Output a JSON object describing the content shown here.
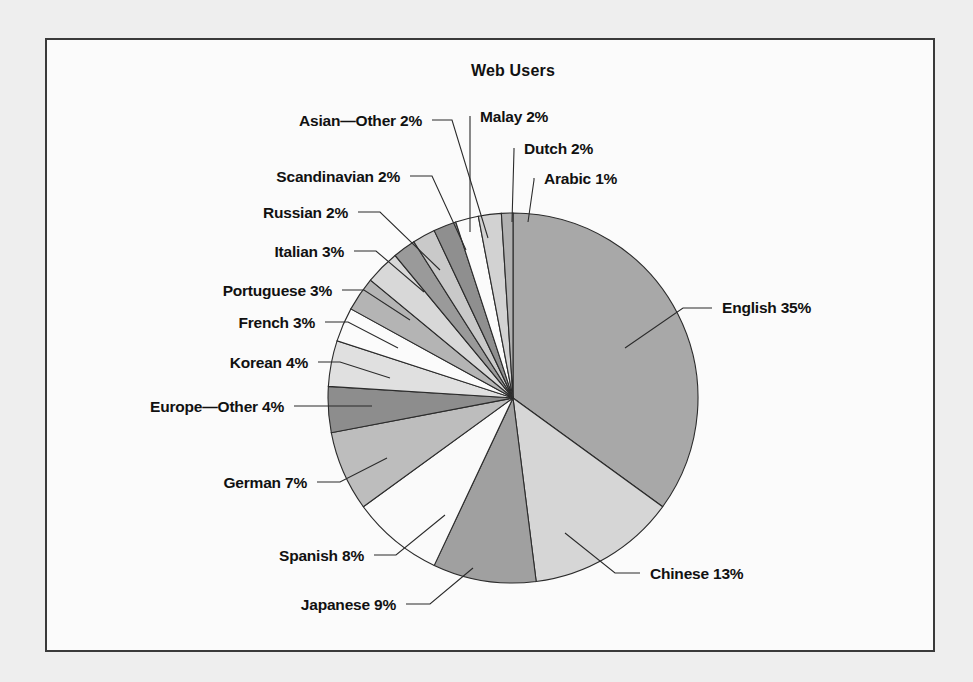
{
  "figure": {
    "title": "Web Users",
    "border_color": "#3a3a3a",
    "panel_background": "#fbfbfb",
    "page_background": "#eeeeee"
  },
  "chart_data": {
    "type": "pie",
    "title": "Web Users",
    "unit": "percent",
    "start_angle_deg": 0,
    "direction": "clockwise",
    "legend": "none",
    "labels_style": "leader-lines",
    "categories": [
      "English",
      "Chinese",
      "Japanese",
      "Spanish",
      "German",
      "Europe—Other",
      "Korean",
      "French",
      "Portuguese",
      "Italian",
      "Russian",
      "Scandinavian",
      "Asian—Other",
      "Malay",
      "Dutch",
      "Arabic"
    ],
    "values": [
      35,
      13,
      9,
      8,
      7,
      4,
      4,
      3,
      3,
      3,
      2,
      2,
      2,
      2,
      2,
      1
    ],
    "value_labels": [
      "35%",
      "13%",
      "9%",
      "8%",
      "7%",
      "4%",
      "4%",
      "3%",
      "3%",
      "3%",
      "2%",
      "2%",
      "2%",
      "2%",
      "2%",
      "1%"
    ],
    "display_labels": [
      "English 35%",
      "Chinese 13%",
      "Japanese 9%",
      "Spanish 8%",
      "German 7%",
      "Europe—Other 4%",
      "Korean 4%",
      "French 3%",
      "Portuguese 3%",
      "Italian 3%",
      "Russian 2%",
      "Scandinavian 2%",
      "Asian—Other 2%",
      "Malay 2%",
      "Dutch 2%",
      "Arabic 1%"
    ],
    "colors": [
      "#a8a8a8",
      "#d6d6d6",
      "#a0a0a0",
      "#fafafa",
      "#bdbdbd",
      "#8d8d8d",
      "#e0e0e0",
      "#fbfbfb",
      "#b4b4b4",
      "#d8d8d8",
      "#9a9a9a",
      "#c9c9c9",
      "#8f8f8f",
      "#fbfbfb",
      "#d2d2d2",
      "#b0b0b0"
    ]
  },
  "labels": {
    "english": "English 35%",
    "chinese": "Chinese 13%",
    "japanese": "Japanese 9%",
    "spanish": "Spanish 8%",
    "german": "German 7%",
    "europe_other": "Europe—Other 4%",
    "korean": "Korean 4%",
    "french": "French 3%",
    "portuguese": "Portuguese 3%",
    "italian": "Italian 3%",
    "russian": "Russian 2%",
    "scandinavian": "Scandinavian 2%",
    "asian_other": "Asian—Other 2%",
    "malay": "Malay 2%",
    "dutch": "Dutch 2%",
    "arabic": "Arabic 1%"
  }
}
